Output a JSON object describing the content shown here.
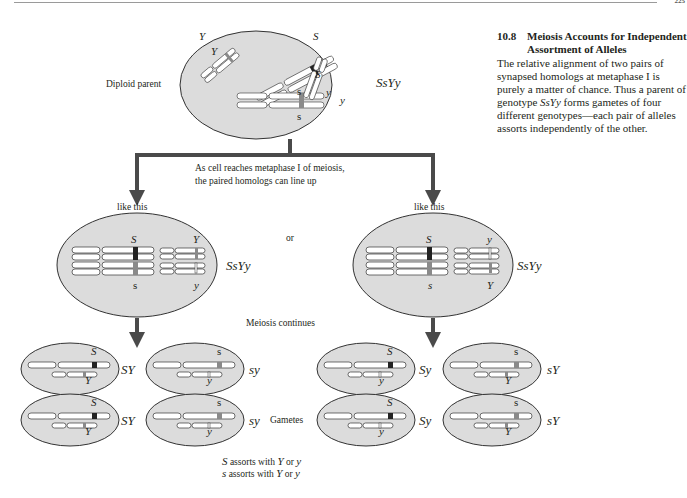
{
  "header": {
    "page_number": "225"
  },
  "sidebar": {
    "section_number": "10.8",
    "section_title": "Meiosis Accounts for Independent Assortment of Alleles",
    "body_part1": "The relative alignment of two pairs of synapsed homologs at metaphase I is purely a matter of chance. Thus a parent of genotype ",
    "body_genotype": "SsYy",
    "body_part2": " forms gametes of four different genotypes—each pair of alleles assorts independently of the other."
  },
  "diagram": {
    "parent": {
      "label": "Diploid parent",
      "genotype": "SsYy",
      "alleles": [
        "Y",
        "Y",
        "S",
        "S",
        "s",
        "s",
        "y",
        "y"
      ]
    },
    "metaphase_note_line1": "As cell reaches metaphase I of meiosis,",
    "metaphase_note_line2": "the paired homologs can line up",
    "or_label": "or",
    "meiosis_continues": "Meiosis continues",
    "gametes_label": "Gametes",
    "left_branch": {
      "label": "like this",
      "genotype": "SsYy",
      "top_alleles": [
        "S",
        "Y"
      ],
      "bottom_alleles": [
        "s",
        "y"
      ],
      "gametes": [
        {
          "genotype": "SY",
          "big": "S",
          "small": "Y"
        },
        {
          "genotype": "sy",
          "big": "s",
          "small": "y"
        },
        {
          "genotype": "SY",
          "big": "S",
          "small": "Y"
        },
        {
          "genotype": "sy",
          "big": "s",
          "small": "y"
        }
      ]
    },
    "right_branch": {
      "label": "like this",
      "genotype": "SsYy",
      "top_alleles": [
        "S",
        "y"
      ],
      "bottom_alleles": [
        "s",
        "Y"
      ],
      "gametes": [
        {
          "genotype": "Sy",
          "big": "S",
          "small": "y"
        },
        {
          "genotype": "sY",
          "big": "s",
          "small": "Y"
        },
        {
          "genotype": "Sy",
          "big": "S",
          "small": "y"
        },
        {
          "genotype": "sY",
          "big": "s",
          "small": "Y"
        }
      ]
    },
    "assortment_note": {
      "line1_prefix": "S",
      "line1_text": " assorts with ",
      "line1_a": "Y",
      "line1_or": " or ",
      "line1_b": "y",
      "line2_prefix": "s",
      "line2_text": " assorts with ",
      "line2_a": "Y",
      "line2_or": " or ",
      "line2_b": "y"
    },
    "colors": {
      "cell_fill": "#dcdcdc",
      "arrow": "#4a4a4a",
      "dominant_band": "#222222",
      "recessive_band": "#8a8a8a"
    }
  }
}
